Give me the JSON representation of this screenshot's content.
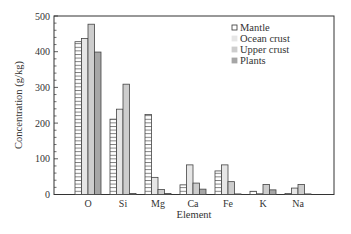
{
  "chart_data": {
    "type": "bar",
    "title": "",
    "xlabel": "Element",
    "ylabel": "Concentration (g/kg)",
    "ylim": [
      0,
      500
    ],
    "yticks": [
      0,
      100,
      200,
      300,
      400,
      500
    ],
    "grid": false,
    "legend_position": "upper right",
    "categories": [
      "O",
      "Si",
      "Mg",
      "Ca",
      "Fe",
      "K",
      "Na"
    ],
    "series": [
      {
        "name": "Mantle",
        "fill": "#ffffff",
        "hatch": "horizontal",
        "values": [
          428,
          211,
          224,
          27,
          66,
          9,
          3
        ]
      },
      {
        "name": "Ocean crust",
        "fill": "#e6e6e6",
        "hatch": "none",
        "values": [
          437,
          239,
          48,
          83,
          83,
          2,
          18
        ]
      },
      {
        "name": "Upper crust",
        "fill": "#cdcdcd",
        "hatch": "none",
        "values": [
          477,
          309,
          14,
          32,
          36,
          28,
          28
        ]
      },
      {
        "name": "Plants",
        "fill": "#a6a6a6",
        "hatch": "none",
        "values": [
          399,
          3,
          3,
          15,
          1,
          13,
          1
        ]
      }
    ]
  }
}
